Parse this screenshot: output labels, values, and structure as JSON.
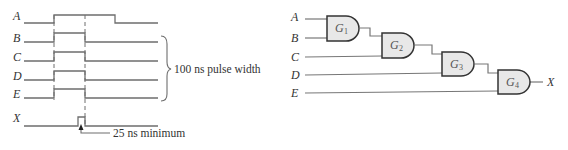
{
  "timing_diagram": {
    "signals": [
      {
        "name": "A"
      },
      {
        "name": "B"
      },
      {
        "name": "C"
      },
      {
        "name": "D"
      },
      {
        "name": "E"
      },
      {
        "name": "X"
      }
    ],
    "brace_annotation": "100 ns pulse width",
    "glitch_annotation": "25 ns minimum"
  },
  "logic_circuit": {
    "inputs": [
      "A",
      "B",
      "C",
      "D",
      "E"
    ],
    "gates": [
      {
        "letter": "G",
        "sub": "1"
      },
      {
        "letter": "G",
        "sub": "2"
      },
      {
        "letter": "G",
        "sub": "3"
      },
      {
        "letter": "G",
        "sub": "4"
      }
    ],
    "output": "X"
  },
  "colors": {
    "line": "#6e6e6e",
    "gate_fill": "#e8e8e8",
    "gate_stroke": "#333333"
  }
}
